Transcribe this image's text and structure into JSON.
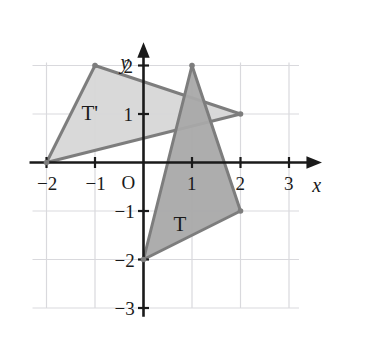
{
  "figure": {
    "background_color": "#ffffff"
  },
  "chart_data": {
    "type": "scatter",
    "title": "",
    "xlabel": "x",
    "ylabel": "y",
    "xlim": [
      -2.6,
      3.6
    ],
    "ylim": [
      -3.3,
      2.4
    ],
    "grid": true,
    "legend": "none",
    "axis_color": "#1a1a1a",
    "grid_color": "#d9d9dd",
    "origin_label": "O",
    "xticks": [
      -2,
      -1,
      1,
      2,
      3
    ],
    "xtick_labels": [
      "−2",
      "−1",
      "1",
      "2",
      "3"
    ],
    "yticks": [
      2,
      1,
      -1,
      -2,
      -3
    ],
    "ytick_labels": [
      "2",
      "1",
      "−1",
      "−2",
      "−3"
    ],
    "grid_x_lines": [
      -2,
      -1,
      0,
      1,
      2,
      3
    ],
    "grid_y_lines": [
      2,
      1,
      0,
      -1,
      -2,
      -3
    ],
    "series": [
      {
        "name": "T",
        "label": "T",
        "label_position": [
          0.62,
          -1.28
        ],
        "type": "polygon",
        "points": [
          [
            1,
            2
          ],
          [
            2,
            -1
          ],
          [
            0,
            -2
          ]
        ],
        "fill": "#a9a9a9",
        "fill_opacity": 0.95,
        "stroke": "#7d7d7d",
        "stroke_width": 3,
        "vertex_marker": true
      },
      {
        "name": "T-prime",
        "label": "T'",
        "label_position": [
          -1.28,
          1.0
        ],
        "type": "polygon",
        "points": [
          [
            -1,
            2
          ],
          [
            2,
            1
          ],
          [
            -2,
            0
          ]
        ],
        "fill": "#d7d7d7",
        "fill_opacity": 0.95,
        "stroke": "#7d7d7d",
        "stroke_width": 3,
        "vertex_marker": true
      }
    ]
  },
  "labels": {
    "x_axis": "x",
    "y_axis": "y",
    "origin": "O",
    "triangle_t": "T",
    "triangle_t_prime": "T'"
  }
}
